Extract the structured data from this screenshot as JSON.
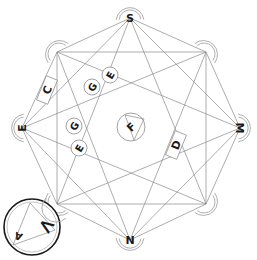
{
  "diagram": {
    "type": "octagram",
    "vertices": [
      {
        "id": "v0",
        "label": "S",
        "x": 130,
        "y": 18,
        "rot": 0
      },
      {
        "id": "v1",
        "label": "",
        "x": 206,
        "y": 52,
        "rot": 45
      },
      {
        "id": "v2",
        "label": "M",
        "x": 240,
        "y": 128,
        "rot": 90
      },
      {
        "id": "v3",
        "label": "",
        "x": 206,
        "y": 204,
        "rot": 135
      },
      {
        "id": "v4",
        "label": "N",
        "x": 130,
        "y": 240,
        "rot": 0
      },
      {
        "id": "v5",
        "label": "",
        "x": 57,
        "y": 204,
        "rot": 225
      },
      {
        "id": "v6",
        "label": "E",
        "x": 22,
        "y": 128,
        "rot": -90
      },
      {
        "id": "v7",
        "label": "",
        "x": 57,
        "y": 52,
        "rot": 315
      }
    ],
    "rect_labels": [
      {
        "id": "C",
        "label": "C",
        "x": 47,
        "y": 90,
        "rot": 22
      },
      {
        "id": "D",
        "label": "D",
        "x": 176,
        "y": 145,
        "rot": 22
      }
    ],
    "circle_nodes": [
      {
        "label": "E",
        "x": 110,
        "y": 75,
        "rot": -60
      },
      {
        "label": "G",
        "x": 92,
        "y": 87,
        "rot": -60
      },
      {
        "label": "G",
        "x": 74,
        "y": 126,
        "rot": -60
      },
      {
        "label": "E",
        "x": 79,
        "y": 148,
        "rot": -60
      }
    ],
    "center": {
      "label": "F",
      "x": 131,
      "y": 127
    },
    "corner_seal": {
      "glyph_1": "<",
      "glyph_2": "A",
      "x": 32,
      "y": 227
    }
  }
}
